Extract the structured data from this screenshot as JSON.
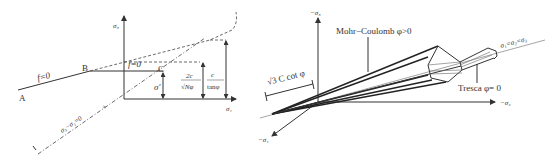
{
  "left_diagram": {
    "axis_vertical_label": "σ₃",
    "axis_horizontal_label": "σ₁",
    "point_a": "A",
    "point_b": "B",
    "point_c": "C",
    "yield_label_left": "f=0",
    "yield_label_mid": "f=0",
    "sigma_prime": "σ'",
    "frac1_num": "2c",
    "frac1_den": "√Nφ",
    "frac2_num": "c",
    "frac2_den": "tanφ",
    "diagonal_label": "σ₃−σ₁=0",
    "tick_label": "+"
  },
  "right_diagram": {
    "axis_up_label": "−σ₃",
    "axis_right_label": "−σ₂",
    "axis_down_label": "−σ₁",
    "hydrostatic_label": "σ₁=σ₂=σ₃",
    "mohr_coulomb_label": "Mohr−Coulomb φ>0",
    "tresca_label": "Tresca φ= 0",
    "apex_distance_label": "√3 C cot φ"
  }
}
